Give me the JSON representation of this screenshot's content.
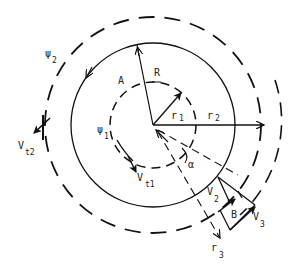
{
  "diagram": {
    "type": "vortex-circulation-geometry",
    "center": {
      "x": 153,
      "y": 125
    },
    "circles": {
      "inner_dashed": {
        "label": "r1",
        "radius": 43
      },
      "solid": {
        "radius": 82
      },
      "outer_dashed": {
        "label": "psi2",
        "radius": 108
      },
      "outermost_dashed_arc": {
        "radius": 128
      }
    },
    "labels": {
      "A": "A",
      "R": "R",
      "r1": "r",
      "r1_sub": "1",
      "r2": "r",
      "r2_sub": "2",
      "r3": "r",
      "r3_sub": "3",
      "psi1": "ψ",
      "psi1_sub": "1",
      "psi2": "ψ",
      "psi2_sub": "2",
      "vt1": "V",
      "vt1_sub": "t1",
      "vt2": "V",
      "vt2_sub": "t2",
      "v2": "V",
      "v2_sub": "2",
      "v3": "V",
      "v3_sub": "3",
      "B": "B",
      "alpha": "α"
    },
    "colors": {
      "stroke": "#111111",
      "background": "#ffffff"
    }
  }
}
